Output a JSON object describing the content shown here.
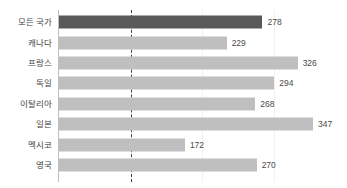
{
  "chart_data": {
    "type": "bar",
    "orientation": "horizontal",
    "title": "",
    "subtitle": "",
    "xlabel": "",
    "ylabel": "",
    "categories": [
      "모든 국가",
      "캐나다",
      "프랑스",
      "독일",
      "이탈리아",
      "일본",
      "멕시코",
      "영국"
    ],
    "values": [
      278,
      229,
      326,
      294,
      268,
      347,
      172,
      270
    ],
    "value_labels": [
      "278",
      "229",
      "326",
      "294",
      "268",
      "347",
      "172",
      "270"
    ],
    "xlim": [
      0,
      347
    ],
    "ylim": null,
    "grid": true,
    "gridlines_x": [
      98,
      196,
      294
    ],
    "legend": null,
    "legend_position": "none",
    "annotations": [
      {
        "type": "reference-line",
        "orientation": "vertical",
        "value": 98,
        "style": "dashed",
        "color": "#3f3f3f"
      }
    ],
    "series": [
      {
        "name": "",
        "values": [
          278,
          229,
          326,
          294,
          268,
          347,
          172,
          270
        ]
      }
    ],
    "highlight_index": 0
  },
  "colors": {
    "bar": "#BFBFBF",
    "bar_highlight": "#595959",
    "axis": "#BFBFBF",
    "gridline": "#F2F2F2",
    "reference_line": "#3F3F3F",
    "label_text": "#3F3F3F",
    "value_text": "#4A4A4A",
    "background": "#FFFFFF"
  }
}
